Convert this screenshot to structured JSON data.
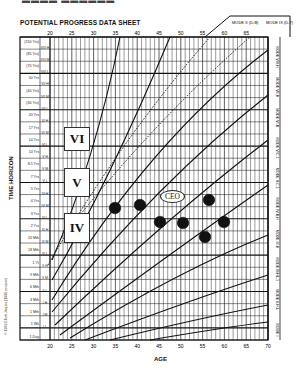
{
  "page": {
    "title": "POTENTIAL PROGRESS DATA SHEET",
    "x_axis_title": "AGE",
    "y_axis_title": "TIME HORIZON",
    "copyright": "© 1983 Elliott Jaques (1991 revision)"
  },
  "regions": {
    "VI": "VI",
    "V": "V",
    "IV": "IV",
    "ceo": "CEO"
  },
  "mode_labels_top": [
    "MODE X (D-B)",
    "MODE IX (D-7)"
  ],
  "mode_labels_right": [
    "MODE VIII-H",
    "MODE VII-H",
    "MODE VI-B",
    "MODE V/C-1",
    "MODE V-C-1",
    "MODE IV-B-H",
    "MODE III-H",
    "MODE III/HL-1",
    "MODE II-H-L",
    "MODE I"
  ],
  "chart_data": {
    "type": "scatter",
    "title": "POTENTIAL PROGRESS DATA SHEET",
    "xlabel": "AGE",
    "ylabel": "TIME HORIZON",
    "x_ticks_bottom": [
      20,
      25,
      30,
      35,
      40,
      45,
      50,
      55,
      60,
      65,
      70
    ],
    "x_ticks_top": [
      20,
      25,
      30,
      35,
      40,
      45,
      50,
      55,
      60,
      65
    ],
    "xlim": [
      20,
      70
    ],
    "y_ticks": [
      "(150 Yrs)",
      "(85 Yrs)",
      "(70 Yrs)",
      "50 Yrs",
      "(40 Yrs)",
      "(30 Yrs)",
      "20 Yrs",
      "17 Yrs",
      "14 Yrs",
      "10 Yrs",
      "8.5 Yrs",
      "7 Yrs",
      "5 Yrs",
      "4 Yrs",
      "3 Yrs",
      "2 Yrs",
      "20 Mth",
      "18 Mth",
      "1 Yr",
      "9 Mth",
      "6 Mth",
      "3 Mth",
      "1 Mth",
      "1 Wk",
      "1 Day"
    ],
    "strata": [
      "VIII H",
      "VIII M",
      "VIII L",
      "VII H",
      "VII M",
      "VII L",
      "VI H",
      "VI M",
      "VI L",
      "V H",
      "V M",
      "V L",
      "IV H",
      "IV M",
      "IV L",
      "III H",
      "III M",
      "III L",
      "II H",
      "II M",
      "II L",
      "I H",
      "I M",
      "I L"
    ],
    "grid": true,
    "legend": "none",
    "annotations": [
      "VI",
      "V",
      "IV",
      "CEO",
      "MODE X (D-B)",
      "MODE IX (D-7)"
    ],
    "points": [
      {
        "age": 34,
        "time_horizon": "≈5 Yrs",
        "px": [
          115,
          208
        ]
      },
      {
        "age": 40,
        "time_horizon": "≈5.5 Yrs",
        "px": [
          140,
          205
        ]
      },
      {
        "age": 43,
        "time_horizon": "≈4 Yrs",
        "px": [
          160,
          222
        ]
      },
      {
        "age": 48,
        "time_horizon": "≈4 Yrs",
        "px": [
          183,
          223
        ]
      },
      {
        "age": 54,
        "time_horizon": "≈6 Yrs",
        "px": [
          209,
          200
        ]
      },
      {
        "age": 57,
        "time_horizon": "≈4 Yrs",
        "px": [
          224,
          222
        ]
      },
      {
        "age": 53,
        "time_horizon": "≈3.5 Yrs",
        "px": [
          205,
          237
        ]
      }
    ]
  }
}
